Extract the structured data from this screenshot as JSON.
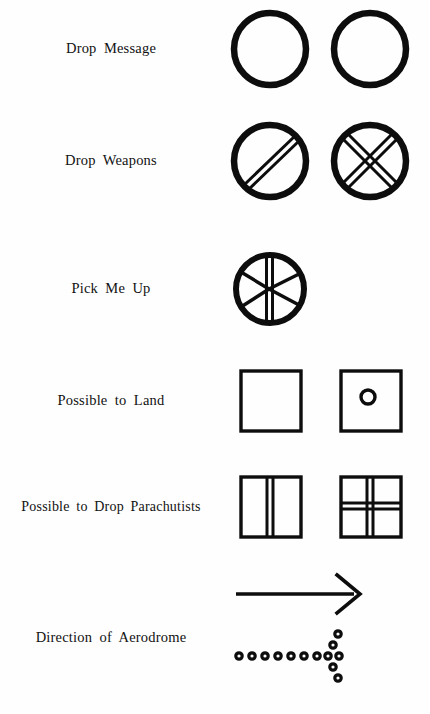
{
  "document": {
    "kind": "ground-to-air-signal-code-chart",
    "background_color": "#fefefe",
    "ink_color": "#0d0d0d"
  },
  "rows": [
    {
      "id": "drop-message",
      "label": "Drop Message",
      "symbols": [
        {
          "name": "circle-outline",
          "description": "plain circle"
        },
        {
          "name": "circle-outline",
          "description": "plain circle"
        }
      ]
    },
    {
      "id": "drop-weapons",
      "label": "Drop Weapons",
      "symbols": [
        {
          "name": "circle-with-diagonal-bar",
          "description": "circle crossed by a double diagonal bar"
        },
        {
          "name": "circle-with-cross",
          "description": "circle crossed by a double X"
        }
      ]
    },
    {
      "id": "pick-me-up",
      "label": "Pick Me Up",
      "symbols": [
        {
          "name": "circle-with-spokes",
          "description": "circle with vertical double bar and four diagonal spokes"
        }
      ]
    },
    {
      "id": "possible-to-land",
      "label": "Possible to Land",
      "symbols": [
        {
          "name": "square-outline",
          "description": "plain square"
        },
        {
          "name": "square-with-dot",
          "description": "square containing a small circle"
        }
      ]
    },
    {
      "id": "possible-to-drop-parachutists",
      "label": "Possible to Drop Parachutists",
      "symbols": [
        {
          "name": "square-with-vertical-bar",
          "description": "square with a vertical double bar"
        },
        {
          "name": "square-with-grid",
          "description": "square with vertical and horizontal double bars"
        }
      ]
    },
    {
      "id": "direction-of-aerodrome",
      "label": "Direction of Aerodrome",
      "symbols": [
        {
          "name": "arrow-right",
          "description": "solid arrow pointing right"
        },
        {
          "name": "arrow-right-dotted",
          "description": "arrow pointing right formed from round dots",
          "shaft_dots": 8,
          "head_dots": 6
        }
      ]
    }
  ]
}
